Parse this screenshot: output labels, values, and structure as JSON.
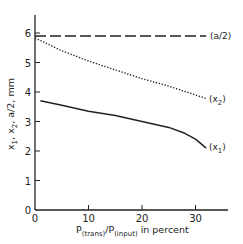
{
  "chart_data": {
    "type": "line",
    "title": "",
    "xlabel": "P(trans)/P(input) in percent",
    "xlabel_parts": {
      "p1": "P",
      "sub1": "(trans)",
      "slash": "/P",
      "sub2": "(input)",
      "rest": " in percent"
    },
    "ylabel": "x1, x2, a/2, mm",
    "ylabel_parts": {
      "x": "x",
      "s1": "1",
      "comma1": ", x",
      "s2": "2",
      "rest": ", a/2,  mm"
    },
    "xlim": [
      0,
      35
    ],
    "ylim": [
      0,
      6.5
    ],
    "x_ticks": [
      0,
      10,
      20,
      30
    ],
    "y_ticks": [
      0,
      1,
      2,
      3,
      4,
      5,
      6
    ],
    "grid": false,
    "legend": "inline labels at right end of curves",
    "series": [
      {
        "name": "(a/2)",
        "style": "dashed",
        "x": [
          0,
          5,
          10,
          15,
          20,
          25,
          30,
          32
        ],
        "y": [
          5.9,
          5.9,
          5.9,
          5.9,
          5.9,
          5.9,
          5.9,
          5.9
        ]
      },
      {
        "name": "(x2)",
        "style": "dotted",
        "x": [
          0,
          5,
          10,
          15,
          20,
          25,
          30,
          32
        ],
        "y": [
          5.83,
          5.4,
          5.05,
          4.75,
          4.45,
          4.2,
          3.9,
          3.78
        ]
      },
      {
        "name": "(x1)",
        "style": "solid",
        "x": [
          1,
          5,
          10,
          15,
          20,
          25,
          28,
          30,
          32
        ],
        "y": [
          3.7,
          3.55,
          3.35,
          3.2,
          3.0,
          2.8,
          2.6,
          2.4,
          2.1
        ]
      }
    ],
    "labels": {
      "a2": {
        "open": "(a/2)"
      },
      "x2": {
        "open": "(x",
        "sub": "2",
        "close": ")"
      },
      "x1": {
        "open": "(x",
        "sub": "1",
        "close": ")"
      }
    }
  }
}
